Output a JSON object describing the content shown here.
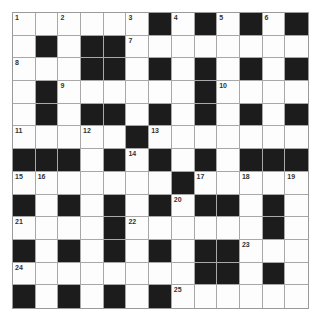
{
  "puzzle": {
    "rows": 13,
    "cols": 13,
    "colors": {
      "block": "#1c1c1c",
      "cell": "#fdfdfd",
      "gridline": "#a8a8a8",
      "number": "#333333"
    },
    "grid": [
      "WWWWWWBWBWBWB",
      "WBWBBWWWWWWWW",
      "WWWBBWBWBWBWB",
      "WBWWWWWWBWWWW",
      "WBWBBWBWBWBWB",
      "WWWWWBWWWWWWW",
      "BBBWBWBWBWBBB",
      "WWWWWWWBWWWWW",
      "BWBWBWBWBBWBW",
      "WWWWBWWWWWWBW",
      "BWBWBWBWBBWWW",
      "WWWWWWWWBBWBW",
      "BWBWBWBWWWWWW"
    ],
    "numbers": [
      {
        "row": 0,
        "col": 0,
        "n": "1"
      },
      {
        "row": 0,
        "col": 2,
        "n": "2"
      },
      {
        "row": 0,
        "col": 5,
        "n": "3"
      },
      {
        "row": 0,
        "col": 7,
        "n": "4"
      },
      {
        "row": 0,
        "col": 9,
        "n": "5"
      },
      {
        "row": 0,
        "col": 11,
        "n": "6"
      },
      {
        "row": 1,
        "col": 5,
        "n": "7"
      },
      {
        "row": 2,
        "col": 0,
        "n": "8"
      },
      {
        "row": 3,
        "col": 2,
        "n": "9"
      },
      {
        "row": 3,
        "col": 9,
        "n": "10"
      },
      {
        "row": 5,
        "col": 0,
        "n": "11"
      },
      {
        "row": 5,
        "col": 3,
        "n": "12"
      },
      {
        "row": 5,
        "col": 6,
        "n": "13"
      },
      {
        "row": 6,
        "col": 5,
        "n": "14"
      },
      {
        "row": 7,
        "col": 0,
        "n": "15"
      },
      {
        "row": 7,
        "col": 1,
        "n": "16"
      },
      {
        "row": 7,
        "col": 8,
        "n": "17"
      },
      {
        "row": 7,
        "col": 10,
        "n": "18"
      },
      {
        "row": 7,
        "col": 12,
        "n": "19"
      },
      {
        "row": 8,
        "col": 7,
        "n": "20"
      },
      {
        "row": 9,
        "col": 0,
        "n": "21"
      },
      {
        "row": 9,
        "col": 5,
        "n": "22"
      },
      {
        "row": 10,
        "col": 10,
        "n": "23"
      },
      {
        "row": 11,
        "col": 0,
        "n": "24"
      },
      {
        "row": 12,
        "col": 7,
        "n": "25"
      }
    ]
  }
}
